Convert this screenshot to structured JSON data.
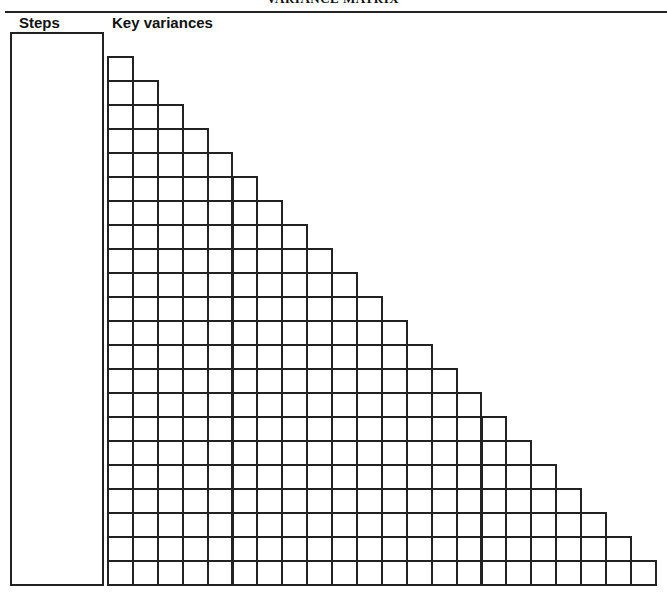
{
  "title": "VARIANCE MATRIX",
  "headers": {
    "steps": "Steps",
    "key_variances": "Key variances"
  },
  "matrix": {
    "rows": 22,
    "cell_width": 24.9,
    "cell_height": 24,
    "shape": "lower-triangular"
  },
  "colors": {
    "line": "#222222",
    "background": "#ffffff"
  }
}
